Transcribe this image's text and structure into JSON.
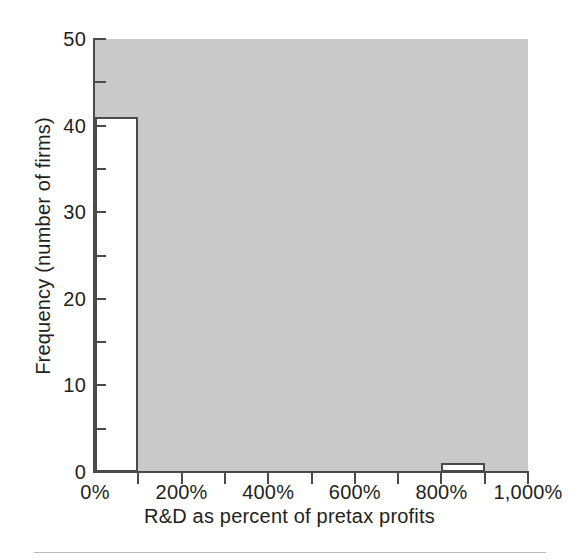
{
  "chart_data": {
    "type": "bar",
    "title": "",
    "subtitle": "",
    "xlabel": "R&D as percent of pretax profits",
    "ylabel": "Frequency (number of firms)",
    "xlim": [
      0,
      1000
    ],
    "ylim": [
      0,
      50
    ],
    "grid": false,
    "legend": false,
    "legend_position": "none",
    "bin_width": 100,
    "x_unit": "%",
    "categories": [
      "0%-100%",
      "100%-200%",
      "200%-300%",
      "300%-400%",
      "400%-500%",
      "500%-600%",
      "600%-700%",
      "700%-800%",
      "800%-900%",
      "900%-1,000%"
    ],
    "values": [
      41,
      0,
      0,
      0,
      0,
      0,
      0,
      0,
      1,
      0
    ],
    "bins": [
      {
        "start": 0,
        "end": 100,
        "value": 41
      },
      {
        "start": 100,
        "end": 200,
        "value": 0
      },
      {
        "start": 200,
        "end": 300,
        "value": 0
      },
      {
        "start": 300,
        "end": 400,
        "value": 0
      },
      {
        "start": 400,
        "end": 500,
        "value": 0
      },
      {
        "start": 500,
        "end": 600,
        "value": 0
      },
      {
        "start": 600,
        "end": 700,
        "value": 0
      },
      {
        "start": 700,
        "end": 800,
        "value": 0
      },
      {
        "start": 800,
        "end": 900,
        "value": 1
      },
      {
        "start": 900,
        "end": 1000,
        "value": 0
      }
    ],
    "x_tick_labels": [
      "0%",
      "200%",
      "400%",
      "600%",
      "800%",
      "1,000%"
    ],
    "x_tick_values": [
      0,
      200,
      400,
      600,
      800,
      1000
    ],
    "x_minor_tick_values": [
      100,
      300,
      500,
      700,
      900
    ],
    "y_tick_labels": [
      "0",
      "10",
      "20",
      "30",
      "40",
      "50"
    ],
    "y_tick_values": [
      0,
      10,
      20,
      30,
      40,
      50
    ],
    "y_minor_tick_values": [
      5,
      15,
      25,
      35,
      45
    ],
    "colors": {
      "plot_background": "#c9c9c9",
      "bar_fill": "#ffffff",
      "bar_outline": "#4a4a4a",
      "axis": "#4a4a4a",
      "text": "#231f20",
      "footer_rule": "#b9b9b9"
    }
  }
}
